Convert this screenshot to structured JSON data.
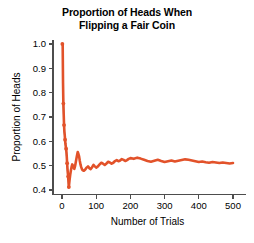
{
  "chart_data": {
    "type": "line",
    "title": "Proportion of Heads When\nFlipping a Fair Coin",
    "title_line1": "Proportion of Heads When",
    "title_line2": "Flipping a Fair Coin",
    "xlabel": "Number of Trials",
    "ylabel": "Proportion of Heads",
    "xlim": [
      0,
      520
    ],
    "ylim": [
      0.39,
      1.02
    ],
    "xticks": [
      0,
      100,
      200,
      300,
      400,
      500
    ],
    "xtick_labels": [
      "0",
      "100",
      "200",
      "300",
      "400",
      "500"
    ],
    "yticks": [
      0.4,
      0.5,
      0.6,
      0.7,
      0.8,
      0.9,
      1.0
    ],
    "ytick_labels": [
      "0.4",
      "0.5",
      "0.6",
      "0.7",
      "0.8",
      "0.9",
      "1.0"
    ],
    "grid": false,
    "legend": false,
    "colors": {
      "data": "#E2522A",
      "connector": "#6CA6CD",
      "axis": "#4D4D4D",
      "background": "#FFFFFF"
    },
    "marker_trials": [
      1,
      4,
      6,
      9,
      12,
      15,
      18,
      20
    ],
    "marker_values": [
      1.0,
      0.755,
      0.667,
      0.607,
      0.57,
      0.51,
      0.455,
      0.412
    ],
    "series": [
      {
        "name": "Running proportion of heads",
        "x": [
          1,
          2,
          3,
          4,
          5,
          6,
          7,
          8,
          9,
          10,
          11,
          12,
          13,
          14,
          15,
          16,
          17,
          18,
          19,
          20,
          22,
          24,
          26,
          28,
          30,
          32,
          34,
          36,
          38,
          40,
          42,
          44,
          46,
          48,
          50,
          52,
          54,
          56,
          58,
          60,
          64,
          68,
          72,
          76,
          80,
          84,
          88,
          92,
          96,
          100,
          105,
          110,
          115,
          120,
          125,
          130,
          135,
          140,
          145,
          150,
          155,
          160,
          165,
          170,
          175,
          180,
          185,
          190,
          195,
          200,
          210,
          220,
          230,
          240,
          250,
          260,
          270,
          280,
          290,
          300,
          310,
          320,
          330,
          340,
          350,
          360,
          370,
          380,
          390,
          400,
          410,
          420,
          430,
          440,
          450,
          460,
          470,
          480,
          490,
          500
        ],
        "y": [
          1.0,
          1.0,
          0.84,
          0.755,
          0.71,
          0.667,
          0.64,
          0.625,
          0.607,
          0.59,
          0.58,
          0.57,
          0.555,
          0.535,
          0.51,
          0.487,
          0.47,
          0.455,
          0.432,
          0.412,
          0.44,
          0.462,
          0.48,
          0.495,
          0.505,
          0.5,
          0.492,
          0.487,
          0.497,
          0.512,
          0.527,
          0.543,
          0.556,
          0.548,
          0.538,
          0.52,
          0.505,
          0.495,
          0.487,
          0.482,
          0.479,
          0.484,
          0.492,
          0.497,
          0.49,
          0.486,
          0.494,
          0.503,
          0.497,
          0.492,
          0.497,
          0.505,
          0.512,
          0.508,
          0.503,
          0.509,
          0.516,
          0.513,
          0.508,
          0.512,
          0.519,
          0.523,
          0.518,
          0.521,
          0.527,
          0.524,
          0.519,
          0.523,
          0.528,
          0.531,
          0.528,
          0.533,
          0.529,
          0.524,
          0.519,
          0.516,
          0.52,
          0.524,
          0.519,
          0.515,
          0.518,
          0.521,
          0.517,
          0.52,
          0.523,
          0.526,
          0.524,
          0.521,
          0.518,
          0.515,
          0.517,
          0.514,
          0.512,
          0.515,
          0.513,
          0.511,
          0.513,
          0.511,
          0.509,
          0.511
        ]
      }
    ]
  }
}
